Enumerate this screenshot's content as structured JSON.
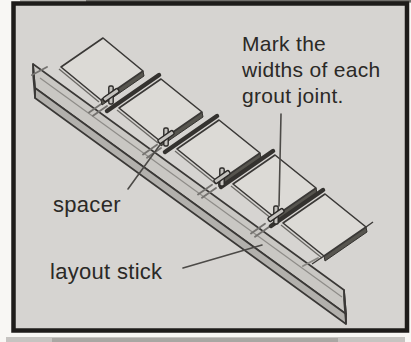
{
  "figure": {
    "note": {
      "lines": [
        "Mark the",
        "widths of each",
        "grout joint."
      ]
    },
    "labels": {
      "spacer": "spacer",
      "layout_stick": "layout stick"
    },
    "depicts": {
      "subject": "layout stick with tiles and spacers marking grout joints",
      "tiles": 5,
      "spacers": 4,
      "joint_marks": 4
    },
    "colors": {
      "frame": "#1e1c1a",
      "background": "#d6d4d1",
      "tile_top": "#dcdad6",
      "stick_top": "#c9c7c3",
      "stick_front": "#b2b0ac",
      "ink": "#3a3836"
    }
  }
}
